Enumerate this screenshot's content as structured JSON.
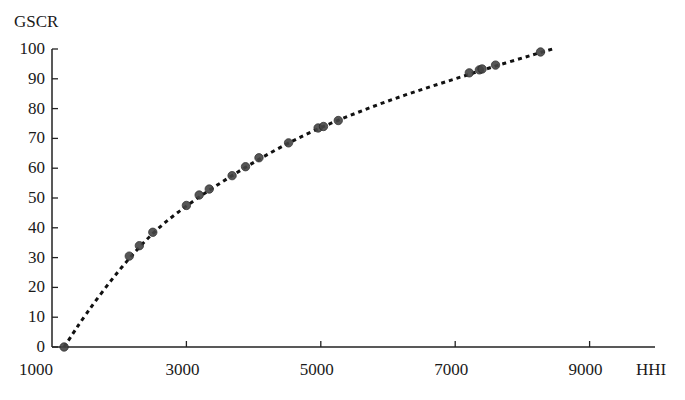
{
  "chart_data": {
    "type": "scatter",
    "title": "",
    "xlabel": "HHI",
    "ylabel": "GSCR",
    "xlim": [
      1000,
      10000
    ],
    "ylim": [
      0,
      100
    ],
    "x_ticks": [
      1000,
      3000,
      5000,
      7000,
      9000
    ],
    "y_ticks": [
      0,
      10,
      20,
      30,
      40,
      50,
      60,
      70,
      80,
      90,
      100
    ],
    "grid": false,
    "legend": null,
    "series": [
      {
        "name": "observations",
        "marker": "circle",
        "color": "#3a3a3a",
        "points": [
          {
            "x": 1180,
            "y": 0
          },
          {
            "x": 2150,
            "y": 30.5
          },
          {
            "x": 2300,
            "y": 34
          },
          {
            "x": 2500,
            "y": 38.5
          },
          {
            "x": 3000,
            "y": 47.5
          },
          {
            "x": 3190,
            "y": 51
          },
          {
            "x": 3340,
            "y": 53
          },
          {
            "x": 3680,
            "y": 57.5
          },
          {
            "x": 3880,
            "y": 60.5
          },
          {
            "x": 4080,
            "y": 63.5
          },
          {
            "x": 4520,
            "y": 68.5
          },
          {
            "x": 4960,
            "y": 73.5
          },
          {
            "x": 5040,
            "y": 74
          },
          {
            "x": 5260,
            "y": 76
          },
          {
            "x": 7210,
            "y": 92
          },
          {
            "x": 7360,
            "y": 93
          },
          {
            "x": 7400,
            "y": 93.3
          },
          {
            "x": 7600,
            "y": 94.6
          },
          {
            "x": 8270,
            "y": 99
          }
        ]
      },
      {
        "name": "fitted curve",
        "style": "dotted",
        "color": "#1a1a1a",
        "points": [
          {
            "x": 1180,
            "y": 0
          },
          {
            "x": 1500,
            "y": 11
          },
          {
            "x": 2000,
            "y": 26
          },
          {
            "x": 2500,
            "y": 38.5
          },
          {
            "x": 3000,
            "y": 47.5
          },
          {
            "x": 3500,
            "y": 55
          },
          {
            "x": 4000,
            "y": 62
          },
          {
            "x": 4500,
            "y": 68.3
          },
          {
            "x": 5000,
            "y": 73.7
          },
          {
            "x": 5500,
            "y": 78.3
          },
          {
            "x": 6000,
            "y": 82.6
          },
          {
            "x": 6500,
            "y": 86.4
          },
          {
            "x": 7000,
            "y": 90
          },
          {
            "x": 7500,
            "y": 93.6
          },
          {
            "x": 8000,
            "y": 97
          },
          {
            "x": 8450,
            "y": 100
          }
        ]
      }
    ]
  },
  "axes": {
    "y_title": "GSCR",
    "x_title": "HHI",
    "y_labels": [
      "0",
      "10",
      "20",
      "30",
      "40",
      "50",
      "60",
      "70",
      "80",
      "90",
      "100"
    ],
    "x_labels": [
      "1000",
      "3000",
      "5000",
      "7000",
      "9000"
    ]
  }
}
